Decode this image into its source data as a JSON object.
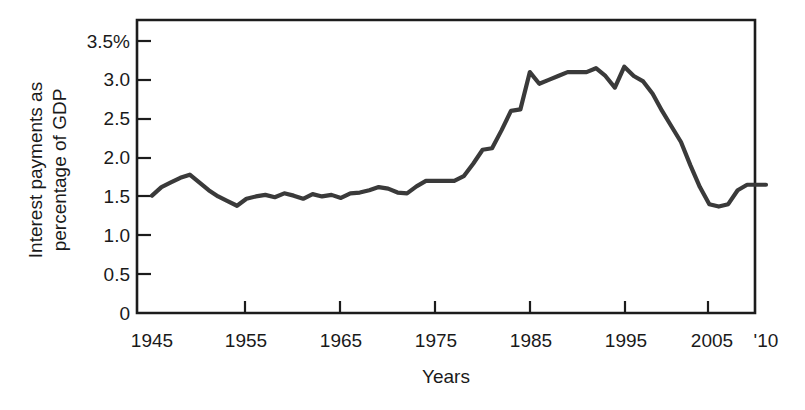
{
  "chart_data": {
    "type": "line",
    "title": "",
    "xlabel": "Years",
    "ylabel": "Interest payments as percentage of GDP",
    "ylabel_line1": "Interest payments as",
    "ylabel_line2": "percentage of GDP",
    "xlim": [
      1945,
      2010
    ],
    "ylim": [
      0,
      3.5
    ],
    "grid": false,
    "legend": false,
    "y_ticks": [
      0,
      0.5,
      1.0,
      1.5,
      2.0,
      2.5,
      3.0,
      3.5
    ],
    "y_tick_labels": [
      "0",
      "0.5",
      "1.0",
      "1.5",
      "2.0",
      "2.5",
      "3.0",
      "3.5%"
    ],
    "x_ticks": [
      1945,
      1955,
      1965,
      1975,
      1985,
      1995,
      2005,
      2010
    ],
    "x_tick_labels": [
      "1945",
      "1955",
      "1965",
      "1975",
      "1985",
      "1995",
      "2005",
      "'10"
    ],
    "line_color": "#3a3a3a",
    "series": [
      {
        "name": "Interest payments as percentage of GDP",
        "x": [
          1945,
          1946,
          1947,
          1948,
          1949,
          1950,
          1951,
          1952,
          1953,
          1954,
          1955,
          1956,
          1957,
          1958,
          1959,
          1960,
          1961,
          1962,
          1963,
          1964,
          1965,
          1966,
          1967,
          1968,
          1969,
          1970,
          1971,
          1972,
          1973,
          1974,
          1975,
          1976,
          1977,
          1978,
          1979,
          1980,
          1981,
          1982,
          1983,
          1984,
          1985,
          1986,
          1987,
          1988,
          1989,
          1990,
          1991,
          1992,
          1993,
          1994,
          1995,
          1996,
          1997,
          1998,
          1999,
          2000,
          2001,
          2002,
          2003,
          2004,
          2005,
          2006,
          2007,
          2008,
          2009,
          2010
        ],
        "values": [
          1.51,
          1.62,
          1.68,
          1.74,
          1.78,
          1.68,
          1.58,
          1.5,
          1.44,
          1.38,
          1.47,
          1.5,
          1.52,
          1.49,
          1.54,
          1.51,
          1.47,
          1.53,
          1.5,
          1.52,
          1.48,
          1.54,
          1.55,
          1.58,
          1.62,
          1.6,
          1.55,
          1.54,
          1.63,
          1.7,
          1.7,
          1.7,
          1.7,
          1.76,
          1.92,
          2.1,
          2.12,
          2.35,
          2.6,
          2.62,
          3.1,
          2.95,
          3.0,
          3.05,
          3.1,
          3.1,
          3.1,
          3.15,
          3.05,
          2.9,
          3.17,
          3.05,
          2.98,
          2.82,
          2.6,
          2.4,
          2.2,
          1.9,
          1.62,
          1.4,
          1.37,
          1.4,
          1.58,
          1.65,
          1.65,
          1.65
        ]
      }
    ]
  },
  "axes": {
    "y_axis_title_line1": "Interest payments as",
    "y_axis_title_line2": "percentage of GDP",
    "x_axis_title": "Years"
  }
}
